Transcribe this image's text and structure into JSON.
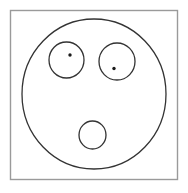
{
  "figure": {
    "canvas": {
      "width": 188,
      "height": 193,
      "background": "#ffffff"
    },
    "frame": {
      "name": "image-border-frame",
      "x": 10.5,
      "y": 10.5,
      "width": 167,
      "height": 169,
      "stroke": "#9a9a9a",
      "stroke_width": 1.4,
      "fill": "#ffffff"
    },
    "face": {
      "name": "face-outline-circle",
      "cx": 94,
      "cy": 94,
      "rx": 72,
      "ry": 75,
      "stroke": "#333333",
      "stroke_width": 1.3,
      "fill": "#ffffff"
    },
    "left_eye": {
      "name": "left-eye-circle",
      "cx": 66.5,
      "cy": 60,
      "rx": 17.5,
      "ry": 18,
      "stroke": "#333333",
      "stroke_width": 1.3,
      "fill": "#ffffff"
    },
    "left_pupil": {
      "name": "left-pupil-dot",
      "cx": 70,
      "cy": 55,
      "r": 1.7,
      "fill": "#1a1a1a"
    },
    "right_eye": {
      "name": "right-eye-circle",
      "cx": 117,
      "cy": 61.5,
      "rx": 18,
      "ry": 18.5,
      "stroke": "#333333",
      "stroke_width": 1.3,
      "fill": "#ffffff"
    },
    "right_pupil": {
      "name": "right-pupil-dot",
      "cx": 114,
      "cy": 68.5,
      "r": 1.7,
      "fill": "#1a1a1a"
    },
    "mouth": {
      "name": "mouth-circle",
      "cx": 92.5,
      "cy": 135,
      "rx": 13.5,
      "ry": 14,
      "stroke": "#333333",
      "stroke_width": 1.3,
      "fill": "#ffffff"
    }
  }
}
